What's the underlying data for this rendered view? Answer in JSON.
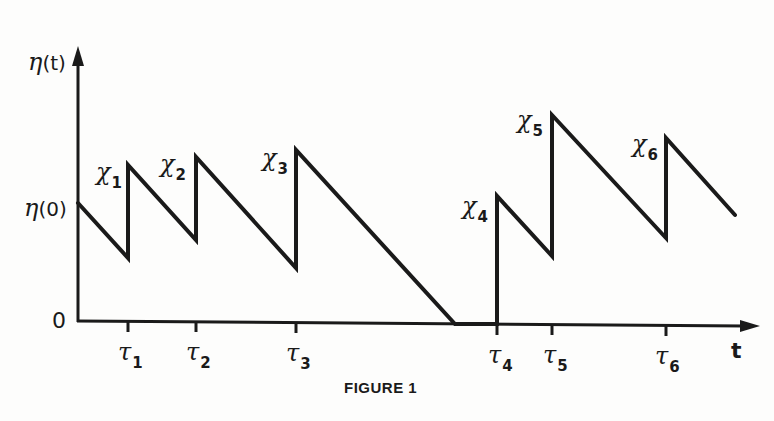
{
  "figure": {
    "caption": "FIGURE 1",
    "y_axis_label": {
      "symbol": "η",
      "arg": "(t)"
    },
    "y_init_label": {
      "symbol": "η",
      "arg": "(0)"
    },
    "origin_label": "0",
    "x_axis_label": "t",
    "colors": {
      "ink": "#1a1a1a",
      "paper": "#fdfdfc"
    }
  },
  "chart_data": {
    "type": "line",
    "title": "FIGURE 1",
    "xlabel": "t",
    "ylabel": "η(t)",
    "x_ticks": [
      "τ1",
      "τ2",
      "τ3",
      "τ4",
      "τ5",
      "τ6"
    ],
    "jump_labels": [
      "χ1",
      "χ2",
      "χ3",
      "χ4",
      "χ5",
      "χ6"
    ],
    "y_ticks": [
      "0",
      "η(0)"
    ],
    "grid": false,
    "legend": null,
    "points_px": [
      [
        78,
        203
      ],
      [
        128,
        258
      ],
      [
        128,
        165
      ],
      [
        196,
        240
      ],
      [
        196,
        157
      ],
      [
        296,
        268
      ],
      [
        296,
        150
      ],
      [
        455,
        324
      ],
      [
        497,
        324
      ],
      [
        497,
        196
      ],
      [
        552,
        256
      ],
      [
        552,
        115
      ],
      [
        666,
        238
      ],
      [
        666,
        138
      ],
      [
        735,
        215
      ]
    ],
    "tick_x_px": [
      128,
      196,
      296,
      497,
      552,
      666
    ]
  },
  "labels": {
    "chi": [
      {
        "base": "χ",
        "sub": "1"
      },
      {
        "base": "χ",
        "sub": "2"
      },
      {
        "base": "χ",
        "sub": "3"
      },
      {
        "base": "χ",
        "sub": "4"
      },
      {
        "base": "χ",
        "sub": "5"
      },
      {
        "base": "χ",
        "sub": "6"
      }
    ],
    "tau": [
      {
        "base": "τ",
        "sub": "1"
      },
      {
        "base": "τ",
        "sub": "2"
      },
      {
        "base": "τ",
        "sub": "3"
      },
      {
        "base": "τ",
        "sub": "4"
      },
      {
        "base": "τ",
        "sub": "5"
      },
      {
        "base": "τ",
        "sub": "6"
      }
    ]
  }
}
